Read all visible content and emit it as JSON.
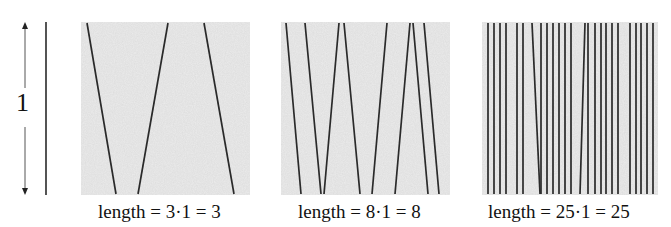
{
  "figure": {
    "scale": {
      "label": "1",
      "arrow": {
        "x": 25,
        "y_top": 22,
        "y_bottom": 195,
        "gap_top": 88,
        "gap_bottom": 127
      },
      "reference_line": {
        "x": 46,
        "y_top": 22,
        "y_bottom": 195
      }
    },
    "colors": {
      "line": "#2a2a2a",
      "panel_fill": "#ececec",
      "text": "#111111"
    },
    "panels": [
      {
        "id": "panel-3",
        "box": {
          "x": 81,
          "y": 22,
          "w": 169,
          "h": 173
        },
        "segment_count": 3,
        "caption": "length = 3·1 = 3",
        "caption_x": 98,
        "segments": [
          [
            87,
            116
          ],
          [
            168,
            138
          ],
          [
            204,
            234
          ]
        ]
      },
      {
        "id": "panel-8",
        "box": {
          "x": 281,
          "y": 22,
          "w": 169,
          "h": 173
        },
        "segment_count": 8,
        "caption": "length = 8·1 = 8",
        "caption_x": 298,
        "segments": [
          [
            286,
            301
          ],
          [
            305,
            321
          ],
          [
            339,
            324
          ],
          [
            344,
            360
          ],
          [
            387,
            372
          ],
          [
            410,
            395
          ],
          [
            413,
            428
          ],
          [
            424,
            439
          ]
        ]
      },
      {
        "id": "panel-25",
        "box": {
          "x": 482,
          "y": 22,
          "w": 176,
          "h": 173
        },
        "segment_count": 25,
        "caption": "length = 25·1 = 25",
        "caption_x": 488,
        "segments": [
          [
            488,
            488
          ],
          [
            494,
            494
          ],
          [
            500,
            500
          ],
          [
            506,
            506
          ],
          [
            517,
            517
          ],
          [
            523,
            523
          ],
          [
            532,
            540
          ],
          [
            541,
            541
          ],
          [
            547,
            547
          ],
          [
            553,
            553
          ],
          [
            559,
            559
          ],
          [
            565,
            565
          ],
          [
            571,
            571
          ],
          [
            585,
            580
          ],
          [
            588,
            588
          ],
          [
            595,
            595
          ],
          [
            601,
            601
          ],
          [
            606,
            606
          ],
          [
            612,
            612
          ],
          [
            618,
            618
          ],
          [
            630,
            630
          ],
          [
            636,
            636
          ],
          [
            641,
            641
          ],
          [
            647,
            647
          ],
          [
            653,
            653
          ]
        ]
      }
    ]
  }
}
